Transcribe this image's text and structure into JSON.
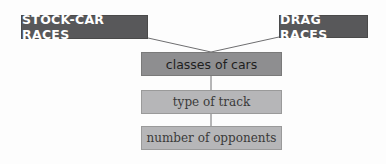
{
  "diagram": {
    "top_nodes": [
      {
        "label": "STOCK-CAR RACES"
      },
      {
        "label": "DRAG RACES"
      }
    ],
    "shared_node": {
      "label": "classes of cars"
    },
    "chain": [
      {
        "label": "type of track"
      },
      {
        "label": "number of opponents"
      }
    ]
  },
  "colors": {
    "top_node_fill": "#58585a",
    "shared_node_fill": "#8e8e90",
    "chain_node_fill": "#b6b6b8",
    "connector": "#6e6e70"
  }
}
